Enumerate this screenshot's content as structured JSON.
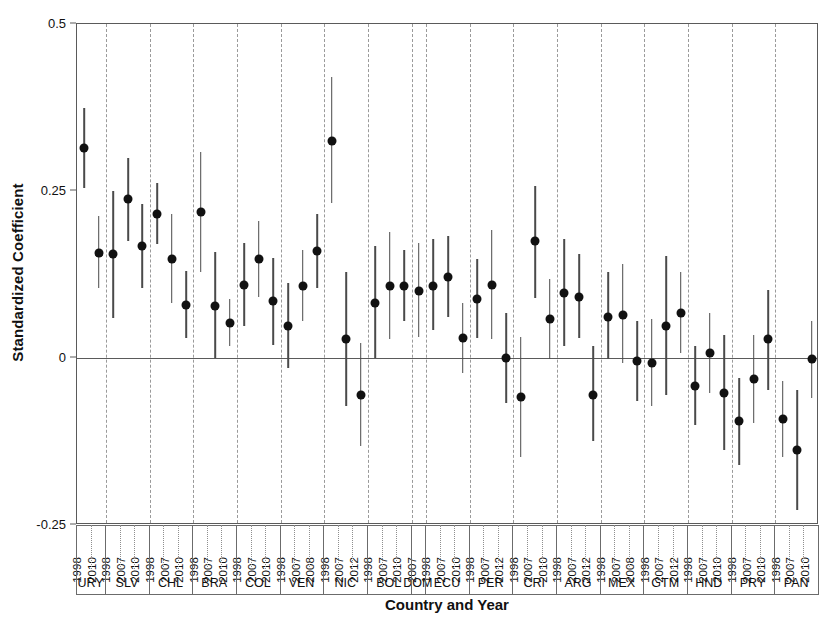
{
  "chart_data": {
    "type": "scatter",
    "title": "",
    "xlabel": "Country and Year",
    "ylabel": "Standardized Coefficient",
    "ylim": [
      -0.25,
      0.5
    ],
    "yticks": [
      0.5,
      0.25,
      0,
      -0.25
    ],
    "ytick_labels": [
      "0.5",
      "0.25",
      "0",
      "-0.25"
    ],
    "grid": false,
    "legend": null,
    "annotations": [
      "horizontal reference line at y = 0",
      "dashed vertical separators between country groups"
    ],
    "point_style": {
      "marker": "filled-circle",
      "color": "#111111",
      "errorbar_color": "#4a4a4a"
    },
    "groups": [
      {
        "country": "URY",
        "points": [
          {
            "year": "1998",
            "value": 0.315,
            "low": 0.255,
            "high": 0.375
          },
          {
            "year": "2010",
            "value": 0.157,
            "low": 0.105,
            "high": 0.212
          }
        ]
      },
      {
        "country": "SLV",
        "points": [
          {
            "year": "1998",
            "value": 0.155,
            "low": 0.06,
            "high": 0.25
          },
          {
            "year": "2007",
            "value": 0.238,
            "low": 0.175,
            "high": 0.3
          },
          {
            "year": "2010",
            "value": 0.168,
            "low": 0.105,
            "high": 0.23
          }
        ]
      },
      {
        "country": "CHL",
        "points": [
          {
            "year": "1998",
            "value": 0.216,
            "low": 0.17,
            "high": 0.262
          },
          {
            "year": "2007",
            "value": 0.148,
            "low": 0.082,
            "high": 0.215
          },
          {
            "year": "2010",
            "value": 0.08,
            "low": 0.03,
            "high": 0.13
          }
        ]
      },
      {
        "country": "BRA",
        "points": [
          {
            "year": "1998",
            "value": 0.218,
            "low": 0.128,
            "high": 0.308
          },
          {
            "year": "2007",
            "value": 0.078,
            "low": 0.0,
            "high": 0.158
          },
          {
            "year": "2010",
            "value": 0.052,
            "low": 0.018,
            "high": 0.088
          }
        ]
      },
      {
        "country": "COL",
        "points": [
          {
            "year": "1998",
            "value": 0.11,
            "low": 0.048,
            "high": 0.172
          },
          {
            "year": "2007",
            "value": 0.148,
            "low": 0.092,
            "high": 0.205
          },
          {
            "year": "2010",
            "value": 0.085,
            "low": 0.02,
            "high": 0.15
          }
        ]
      },
      {
        "country": "VEN",
        "points": [
          {
            "year": "1998",
            "value": 0.048,
            "low": -0.015,
            "high": 0.112
          },
          {
            "year": "2007",
            "value": 0.108,
            "low": 0.055,
            "high": 0.162
          },
          {
            "year": "2008",
            "value": 0.16,
            "low": 0.105,
            "high": 0.215
          }
        ]
      },
      {
        "country": "NIC",
        "points": [
          {
            "year": "1998",
            "value": 0.325,
            "low": 0.232,
            "high": 0.42
          },
          {
            "year": "2007",
            "value": 0.028,
            "low": -0.072,
            "high": 0.128
          },
          {
            "year": "2012",
            "value": -0.055,
            "low": -0.132,
            "high": 0.022
          }
        ]
      },
      {
        "country": "BOL",
        "points": [
          {
            "year": "1998",
            "value": 0.083,
            "low": 0.0,
            "high": 0.168
          },
          {
            "year": "2007",
            "value": 0.108,
            "low": 0.028,
            "high": 0.188
          },
          {
            "year": "2010",
            "value": 0.108,
            "low": 0.055,
            "high": 0.162
          }
        ]
      },
      {
        "country": "DOM",
        "points": [
          {
            "year": "2007",
            "value": 0.1,
            "low": 0.032,
            "high": 0.172
          }
        ]
      },
      {
        "country": "ECU",
        "points": [
          {
            "year": "1998",
            "value": 0.108,
            "low": 0.042,
            "high": 0.178
          },
          {
            "year": "2007",
            "value": 0.122,
            "low": 0.062,
            "high": 0.182
          },
          {
            "year": "2010",
            "value": 0.03,
            "low": -0.022,
            "high": 0.082
          }
        ]
      },
      {
        "country": "PER",
        "points": [
          {
            "year": "1998",
            "value": 0.088,
            "low": 0.03,
            "high": 0.148
          },
          {
            "year": "2007",
            "value": 0.11,
            "low": 0.028,
            "high": 0.192
          },
          {
            "year": "2012",
            "value": 0.0,
            "low": -0.068,
            "high": 0.068
          }
        ]
      },
      {
        "country": "CRI",
        "points": [
          {
            "year": "1998",
            "value": -0.058,
            "low": -0.148,
            "high": 0.032
          },
          {
            "year": "2007",
            "value": 0.175,
            "low": 0.09,
            "high": 0.258
          },
          {
            "year": "2010",
            "value": 0.058,
            "low": -0.002,
            "high": 0.118
          }
        ]
      },
      {
        "country": "ARG",
        "points": [
          {
            "year": "1998",
            "value": 0.098,
            "low": 0.018,
            "high": 0.178
          },
          {
            "year": "2007",
            "value": 0.092,
            "low": 0.03,
            "high": 0.155
          },
          {
            "year": "2012",
            "value": -0.055,
            "low": -0.125,
            "high": 0.018
          }
        ]
      },
      {
        "country": "MEX",
        "points": [
          {
            "year": "1998",
            "value": 0.062,
            "low": -0.002,
            "high": 0.128
          },
          {
            "year": "2007",
            "value": 0.065,
            "low": -0.008,
            "high": 0.14
          },
          {
            "year": "2008",
            "value": -0.005,
            "low": -0.065,
            "high": 0.055
          }
        ]
      },
      {
        "country": "GTM",
        "points": [
          {
            "year": "1998",
            "value": -0.008,
            "low": -0.072,
            "high": 0.058
          },
          {
            "year": "2007",
            "value": 0.048,
            "low": -0.055,
            "high": 0.152
          },
          {
            "year": "2012",
            "value": 0.068,
            "low": 0.008,
            "high": 0.128
          }
        ]
      },
      {
        "country": "HND",
        "points": [
          {
            "year": "1998",
            "value": -0.042,
            "low": -0.1,
            "high": 0.018
          },
          {
            "year": "2007",
            "value": 0.008,
            "low": -0.052,
            "high": 0.068
          },
          {
            "year": "2010",
            "value": -0.052,
            "low": -0.138,
            "high": 0.035
          }
        ]
      },
      {
        "country": "PRY",
        "points": [
          {
            "year": "1998",
            "value": -0.095,
            "low": -0.16,
            "high": -0.03
          },
          {
            "year": "2007",
            "value": -0.032,
            "low": -0.098,
            "high": 0.035
          },
          {
            "year": "2010",
            "value": 0.028,
            "low": -0.048,
            "high": 0.102
          }
        ]
      },
      {
        "country": "PAN",
        "points": [
          {
            "year": "1998",
            "value": -0.092,
            "low": -0.148,
            "high": -0.035
          },
          {
            "year": "2007",
            "value": -0.138,
            "low": -0.228,
            "high": -0.048
          },
          {
            "year": "2010",
            "value": -0.002,
            "low": -0.06,
            "high": 0.055
          }
        ]
      }
    ]
  }
}
